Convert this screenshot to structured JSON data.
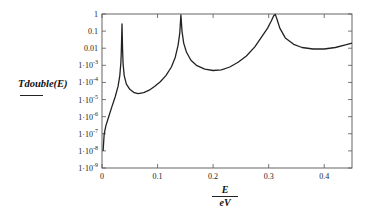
{
  "chart_data": {
    "type": "line",
    "title": "",
    "ylabel": "Tdouble(E)",
    "xlabel_numerator": "E",
    "xlabel_denominator": "eV",
    "xlim": [
      0,
      0.45
    ],
    "ylim": [
      1e-09,
      1
    ],
    "yscale": "log",
    "grid": false,
    "legend": null,
    "x_ticks": [
      "0",
      "0.1",
      "0.2",
      "0.3",
      "0.4"
    ],
    "y_ticks": [
      "1",
      "0.1",
      "0.01",
      "1·10^-3",
      "1·10^-4",
      "1·10^-5",
      "1·10^-6",
      "1·10^-7",
      "1·10^-8",
      "1·10^-9"
    ],
    "series": [
      {
        "name": "Tdouble(E)",
        "color": "#222222",
        "x": [
          0.002,
          0.004,
          0.007,
          0.012,
          0.018,
          0.024,
          0.029,
          0.032,
          0.034,
          0.035,
          0.036,
          0.037,
          0.038,
          0.04,
          0.044,
          0.05,
          0.058,
          0.065,
          0.075,
          0.085,
          0.095,
          0.105,
          0.115,
          0.125,
          0.132,
          0.137,
          0.14,
          0.142,
          0.144,
          0.147,
          0.152,
          0.16,
          0.17,
          0.185,
          0.2,
          0.215,
          0.23,
          0.245,
          0.26,
          0.275,
          0.288,
          0.298,
          0.305,
          0.309,
          0.312,
          0.315,
          0.32,
          0.33,
          0.345,
          0.36,
          0.38,
          0.4,
          0.42,
          0.44,
          0.45
        ],
        "y": [
          1e-08,
          1e-07,
          3e-07,
          1e-06,
          4e-06,
          1.5e-05,
          6e-05,
          0.00025,
          0.0015,
          0.01,
          0.26,
          0.008,
          0.0012,
          0.00025,
          8e-05,
          4e-05,
          2.5e-05,
          2.2e-05,
          2.5e-05,
          3.5e-05,
          6e-05,
          0.00011,
          0.00025,
          0.0008,
          0.003,
          0.015,
          0.08,
          0.9,
          0.1,
          0.02,
          0.006,
          0.002,
          0.001,
          0.0006,
          0.0005,
          0.00055,
          0.0008,
          0.0015,
          0.0035,
          0.012,
          0.05,
          0.15,
          0.4,
          0.8,
          0.95,
          0.5,
          0.15,
          0.04,
          0.017,
          0.011,
          0.009,
          0.009,
          0.011,
          0.016,
          0.02
        ]
      }
    ]
  }
}
